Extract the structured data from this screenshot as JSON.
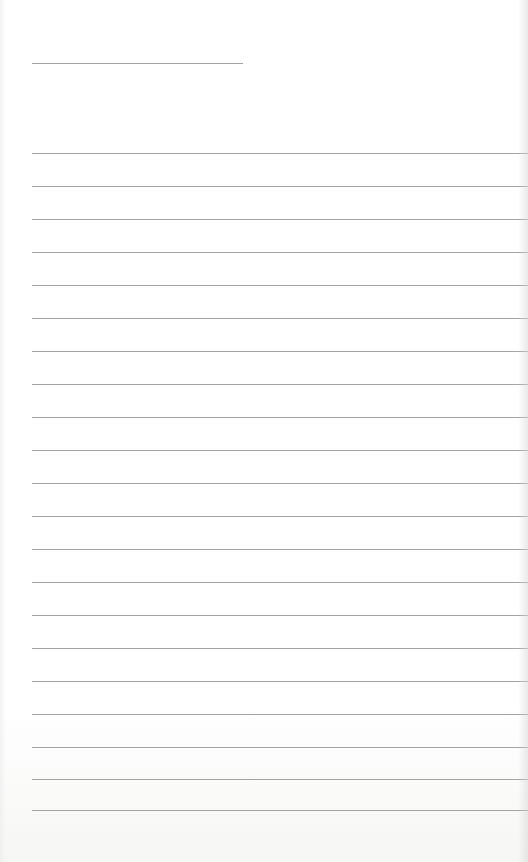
{
  "page": {
    "type": "lined-paper",
    "background_color": "#ffffff",
    "line_color": "#a4a4a4",
    "title_line": {
      "x": 32,
      "y": 63,
      "width": 211
    },
    "rule_lines": {
      "x": 32,
      "width": 496,
      "y_positions": [
        153,
        186,
        219,
        252,
        285,
        318,
        351,
        384,
        417,
        450,
        483,
        516,
        549,
        582,
        615,
        648,
        681,
        714,
        747,
        779,
        810
      ]
    },
    "text": []
  }
}
